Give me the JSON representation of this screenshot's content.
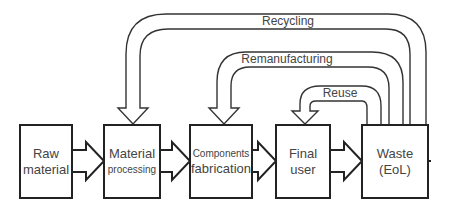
{
  "diagram": {
    "nodes": [
      {
        "id": "raw",
        "line1": "Raw",
        "line2": "material"
      },
      {
        "id": "material",
        "line1": "Material",
        "line2": "processing"
      },
      {
        "id": "components",
        "line1": "Components",
        "line2": "fabrication"
      },
      {
        "id": "final",
        "line1": "Final",
        "line2": "user"
      },
      {
        "id": "waste",
        "line1": "Waste",
        "line2": "(EoL)"
      }
    ],
    "loops": [
      {
        "id": "recycling",
        "label": "Recycling",
        "from": "waste",
        "to": "material"
      },
      {
        "id": "remanufacturing",
        "label": "Remanufacturing",
        "from": "waste",
        "to": "components"
      },
      {
        "id": "reuse",
        "label": "Reuse",
        "from": "waste",
        "to": "final"
      }
    ],
    "colors": {
      "stroke": "#222222",
      "text": "#444444",
      "background": "#ffffff"
    }
  }
}
